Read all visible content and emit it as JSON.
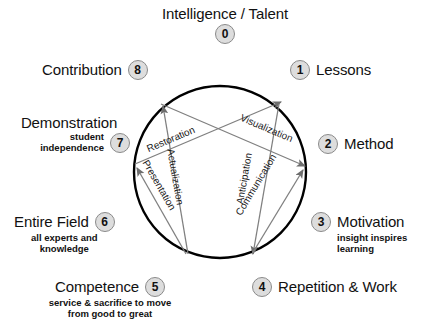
{
  "title": {
    "text": "Intelligence / Talent",
    "node": "0"
  },
  "nodes": [
    {
      "id": "0",
      "label": "Intelligence / Talent",
      "sub": ""
    },
    {
      "id": "1",
      "label": "Lessons",
      "sub": ""
    },
    {
      "id": "2",
      "label": "Method",
      "sub": ""
    },
    {
      "id": "3",
      "label": "Motivation",
      "sub": "insight inspires\nlearning"
    },
    {
      "id": "4",
      "label": "Repetition & Work",
      "sub": ""
    },
    {
      "id": "5",
      "label": "Competence",
      "sub": "service & sacrifice to move\nfrom good to great"
    },
    {
      "id": "6",
      "label": "Entire Field",
      "sub": "all experts and\nknowledge"
    },
    {
      "id": "7",
      "label": "Demonstration",
      "sub": "student\nindependence"
    },
    {
      "id": "8",
      "label": "Contribution",
      "sub": ""
    }
  ],
  "labels": {
    "n0_num": "0",
    "n0_text": "Intelligence / Talent",
    "n1_num": "1",
    "n1_text": "Lessons",
    "n2_num": "2",
    "n2_text": "Method",
    "n3_num": "3",
    "n3_text": "Motivation",
    "n3_sub1": "insight inspires",
    "n3_sub2": "learning",
    "n4_num": "4",
    "n4_text": "Repetition & Work",
    "n5_num": "5",
    "n5_text": "Competence",
    "n5_sub1": "service & sacrifice to move",
    "n5_sub2": "from good to great",
    "n6_num": "6",
    "n6_text": "Entire Field",
    "n6_sub1": "all experts and",
    "n6_sub2": "knowledge",
    "n7_num": "7",
    "n7_text": "Demonstration",
    "n7_sub1": "student",
    "n7_sub2": "independence",
    "n8_num": "8",
    "n8_text": "Contribution"
  },
  "edges": [
    {
      "name": "restoration",
      "label": "Restoration",
      "from": "7",
      "to": "1"
    },
    {
      "name": "visualization",
      "label": "Visualization",
      "from": "8",
      "to": "2"
    },
    {
      "name": "actualization",
      "label": "Actualization",
      "from": "5",
      "to": "8"
    },
    {
      "name": "presentation",
      "label": "Presentation",
      "from": "5",
      "to": "7"
    },
    {
      "name": "anticipation",
      "label": "Anticipation",
      "from": "1",
      "to": "4"
    },
    {
      "name": "communication",
      "label": "Communication",
      "from": "4",
      "to": "2"
    }
  ],
  "edge_labels": {
    "restoration": "Restoration",
    "visualization": "Visualization",
    "actualization": "Actualization",
    "presentation": "Presentation",
    "anticipation": "Anticipation",
    "communication": "Communication"
  },
  "colors": {
    "circle_stroke": "#000000",
    "arrow_stroke": "#808080",
    "node_fill": "#dddddd",
    "node_border": "#8a8a8a",
    "text": "#111111",
    "background": "#ffffff"
  },
  "geometry": {
    "circle_center_x": 220,
    "circle_center_y": 172,
    "circle_radius": 86
  }
}
